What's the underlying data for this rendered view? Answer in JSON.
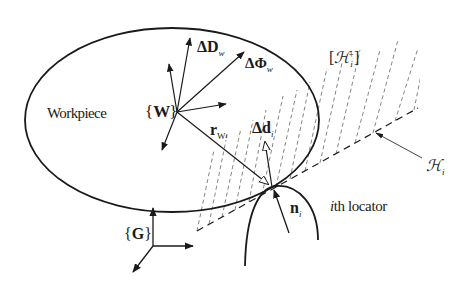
{
  "figure": {
    "workpiece_label": "Workpiece",
    "frame_w": {
      "open": "{",
      "letter": "W",
      "close": "}"
    },
    "frame_g": {
      "open": "{",
      "letter": "G",
      "close": "}"
    },
    "delta_D": {
      "symbol": "ΔD",
      "subscript": "w"
    },
    "delta_Phi": {
      "symbol": "ΔΦ",
      "subscript": "w"
    },
    "delta_d": {
      "symbol": "Δd",
      "subscript": "i"
    },
    "r_vector": {
      "symbol": "r",
      "subscript": "W",
      "subsubscript": "i"
    },
    "normal": {
      "symbol": "n",
      "subscript": "i"
    },
    "halfspace": {
      "open": "[",
      "symbol": "ℋ",
      "subscript": "i",
      "superscript": "+",
      "close": "]"
    },
    "hyperplane": {
      "symbol": "ℋ",
      "subscript": "i"
    },
    "locator_label": {
      "index": "i",
      "text": "th locator"
    }
  },
  "colors": {
    "stroke": "#1a1a1a",
    "dash": "#555555",
    "background": "#ffffff"
  }
}
